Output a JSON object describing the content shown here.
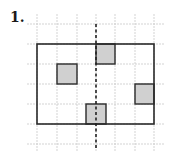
{
  "problem": {
    "number_label": "1."
  },
  "diagram": {
    "grid": {
      "xs": [
        37,
        57,
        77,
        96,
        115,
        135,
        154
      ],
      "ys": [
        24,
        44,
        64,
        84,
        104,
        124,
        144
      ],
      "x_extent": [
        27,
        164
      ],
      "y_extent": [
        14,
        152
      ],
      "color": "#c8c8c8"
    },
    "rectangle": {
      "x": 37,
      "y": 44,
      "w": 117,
      "h": 80,
      "stroke": "#2a2a2a"
    },
    "axis_of_symmetry": {
      "x": 96,
      "y1": 24,
      "y2": 150,
      "style": "dashed"
    },
    "shaded_squares": [
      {
        "name": "top",
        "x": 96,
        "y": 44,
        "w": 19,
        "h": 20
      },
      {
        "name": "left",
        "x": 57,
        "y": 64,
        "w": 20,
        "h": 20
      },
      {
        "name": "right",
        "x": 135,
        "y": 84,
        "w": 19,
        "h": 20
      },
      {
        "name": "bottom",
        "x": 86,
        "y": 104,
        "w": 20,
        "h": 20
      }
    ],
    "shade_color": "#d0d0d0"
  }
}
